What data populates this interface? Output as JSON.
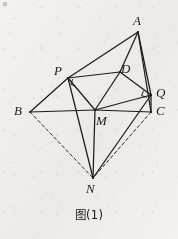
{
  "figure": {
    "caption": "图(1)",
    "background_color": "#f3f2f0",
    "stroke_color": "#1b1b1b",
    "canvas": {
      "width": 178,
      "height": 239
    }
  },
  "vertices": [
    {
      "id": "A",
      "label": "A",
      "x": 138,
      "y": 32,
      "label_x": 133,
      "label_y": 14
    },
    {
      "id": "P",
      "label": "P",
      "x": 68,
      "y": 78,
      "label_x": 54,
      "label_y": 64
    },
    {
      "id": "D",
      "label": "D",
      "x": 120,
      "y": 72,
      "label_x": 121,
      "label_y": 62
    },
    {
      "id": "Q",
      "label": "Q",
      "x": 151,
      "y": 95,
      "label_x": 156,
      "label_y": 86
    },
    {
      "id": "B",
      "label": "B",
      "x": 30,
      "y": 112,
      "label_x": 14,
      "label_y": 104
    },
    {
      "id": "C",
      "label": "C",
      "x": 151,
      "y": 112,
      "label_x": 156,
      "label_y": 104
    },
    {
      "id": "M",
      "label": "M",
      "x": 95,
      "y": 110,
      "label_x": 96,
      "label_y": 114
    },
    {
      "id": "N",
      "label": "N",
      "x": 93,
      "y": 178,
      "label_x": 86,
      "label_y": 182
    }
  ],
  "edges": [
    {
      "from": "A",
      "to": "P",
      "style": "solid"
    },
    {
      "from": "A",
      "to": "D",
      "style": "solid"
    },
    {
      "from": "D",
      "to": "M",
      "style": "solid"
    },
    {
      "from": "A",
      "to": "Q",
      "style": "solid"
    },
    {
      "from": "A",
      "to": "C",
      "style": "solid"
    },
    {
      "from": "P",
      "to": "D",
      "style": "solid"
    },
    {
      "from": "P",
      "to": "M",
      "style": "solid"
    },
    {
      "from": "P",
      "to": "B",
      "style": "solid"
    },
    {
      "from": "P",
      "to": "N",
      "style": "solid"
    },
    {
      "from": "D",
      "to": "Q",
      "style": "solid"
    },
    {
      "from": "B",
      "to": "M",
      "style": "solid"
    },
    {
      "from": "M",
      "to": "C",
      "style": "solid"
    },
    {
      "from": "M",
      "to": "Q",
      "style": "solid"
    },
    {
      "from": "M",
      "to": "N",
      "style": "solid"
    },
    {
      "from": "Q",
      "to": "N",
      "style": "solid"
    },
    {
      "from": "Q",
      "to": "C",
      "style": "solid"
    },
    {
      "from": "B",
      "to": "N",
      "style": "dashed"
    },
    {
      "from": "C",
      "to": "N",
      "style": "dashed"
    }
  ],
  "right_angle_marks": [
    {
      "at": "P",
      "between": [
        "B",
        "N"
      ]
    },
    {
      "at": "Q",
      "between": [
        "A",
        "N"
      ]
    }
  ]
}
